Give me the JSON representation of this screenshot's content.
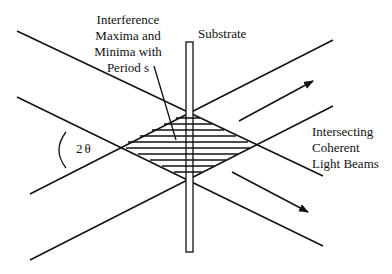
{
  "labels": {
    "interference": [
      "Interference",
      "Maxima and",
      "Minima with",
      "Period s"
    ],
    "substrate": "Substrate",
    "beams": [
      "Intersecting",
      "Coherent",
      "Light Beams"
    ],
    "angle": "2θ"
  },
  "colors": {
    "line": "#111111",
    "background": "#ffffff"
  }
}
